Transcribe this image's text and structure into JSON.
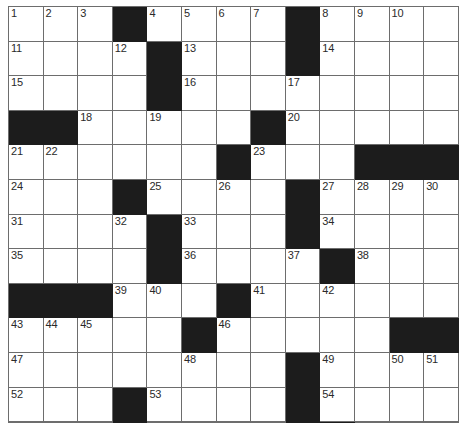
{
  "puzzle": {
    "title": "Crossword Grid",
    "rows": 12,
    "columns": 13,
    "cell_size_px": 34.6,
    "colors": {
      "block": "#1c1c1c",
      "open": "#ffffff",
      "grid_line": "#6d6d6d",
      "number_text": "#2a2a2a"
    },
    "highest_clue_number": 57,
    "grid": [
      [
        {
          "type": "open",
          "number": "1"
        },
        {
          "type": "open",
          "number": "2"
        },
        {
          "type": "open",
          "number": "3"
        },
        {
          "type": "block",
          "number": ""
        },
        {
          "type": "open",
          "number": "4"
        },
        {
          "type": "open",
          "number": "5"
        },
        {
          "type": "open",
          "number": "6"
        },
        {
          "type": "open",
          "number": "7"
        },
        {
          "type": "block",
          "number": ""
        },
        {
          "type": "open",
          "number": "8"
        },
        {
          "type": "open",
          "number": "9"
        },
        {
          "type": "open",
          "number": "10"
        },
        {
          "type": "open",
          "number": ""
        }
      ],
      [
        {
          "type": "open",
          "number": "11"
        },
        {
          "type": "open",
          "number": ""
        },
        {
          "type": "open",
          "number": ""
        },
        {
          "type": "open",
          "number": "12"
        },
        {
          "type": "block",
          "number": ""
        },
        {
          "type": "open",
          "number": "13"
        },
        {
          "type": "open",
          "number": ""
        },
        {
          "type": "open",
          "number": ""
        },
        {
          "type": "block",
          "number": ""
        },
        {
          "type": "open",
          "number": "14"
        },
        {
          "type": "open",
          "number": ""
        },
        {
          "type": "open",
          "number": ""
        },
        {
          "type": "open",
          "number": ""
        }
      ],
      [
        {
          "type": "open",
          "number": "15"
        },
        {
          "type": "open",
          "number": ""
        },
        {
          "type": "open",
          "number": ""
        },
        {
          "type": "open",
          "number": ""
        },
        {
          "type": "block",
          "number": ""
        },
        {
          "type": "open",
          "number": "16"
        },
        {
          "type": "open",
          "number": ""
        },
        {
          "type": "open",
          "number": ""
        },
        {
          "type": "open",
          "number": "17"
        },
        {
          "type": "open",
          "number": ""
        },
        {
          "type": "open",
          "number": ""
        },
        {
          "type": "open",
          "number": ""
        },
        {
          "type": "open",
          "number": ""
        }
      ],
      [
        {
          "type": "block",
          "number": ""
        },
        {
          "type": "block",
          "number": ""
        },
        {
          "type": "open",
          "number": "18"
        },
        {
          "type": "open",
          "number": ""
        },
        {
          "type": "open",
          "number": "19"
        },
        {
          "type": "open",
          "number": ""
        },
        {
          "type": "open",
          "number": ""
        },
        {
          "type": "block",
          "number": ""
        },
        {
          "type": "open",
          "number": "20"
        },
        {
          "type": "open",
          "number": ""
        },
        {
          "type": "open",
          "number": ""
        },
        {
          "type": "open",
          "number": ""
        },
        {
          "type": "open",
          "number": ""
        }
      ],
      [
        {
          "type": "open",
          "number": "21"
        },
        {
          "type": "open",
          "number": "22"
        },
        {
          "type": "open",
          "number": ""
        },
        {
          "type": "open",
          "number": ""
        },
        {
          "type": "open",
          "number": ""
        },
        {
          "type": "open",
          "number": ""
        },
        {
          "type": "block",
          "number": ""
        },
        {
          "type": "open",
          "number": "23"
        },
        {
          "type": "open",
          "number": ""
        },
        {
          "type": "open",
          "number": ""
        },
        {
          "type": "block",
          "number": ""
        },
        {
          "type": "block",
          "number": ""
        },
        {
          "type": "block",
          "number": ""
        }
      ],
      [
        {
          "type": "open",
          "number": "24"
        },
        {
          "type": "open",
          "number": ""
        },
        {
          "type": "open",
          "number": ""
        },
        {
          "type": "block",
          "number": ""
        },
        {
          "type": "open",
          "number": "25"
        },
        {
          "type": "open",
          "number": ""
        },
        {
          "type": "open",
          "number": "26"
        },
        {
          "type": "open",
          "number": ""
        },
        {
          "type": "block",
          "number": ""
        },
        {
          "type": "open",
          "number": "27"
        },
        {
          "type": "open",
          "number": "28"
        },
        {
          "type": "open",
          "number": "29"
        },
        {
          "type": "open",
          "number": "30"
        }
      ],
      [
        {
          "type": "open",
          "number": "31"
        },
        {
          "type": "open",
          "number": ""
        },
        {
          "type": "open",
          "number": ""
        },
        {
          "type": "open",
          "number": "32"
        },
        {
          "type": "block",
          "number": ""
        },
        {
          "type": "open",
          "number": "33"
        },
        {
          "type": "open",
          "number": ""
        },
        {
          "type": "open",
          "number": ""
        },
        {
          "type": "block",
          "number": ""
        },
        {
          "type": "open",
          "number": "34"
        },
        {
          "type": "open",
          "number": ""
        },
        {
          "type": "open",
          "number": ""
        },
        {
          "type": "open",
          "number": ""
        }
      ],
      [
        {
          "type": "open",
          "number": "35"
        },
        {
          "type": "open",
          "number": ""
        },
        {
          "type": "open",
          "number": ""
        },
        {
          "type": "open",
          "number": ""
        },
        {
          "type": "block",
          "number": ""
        },
        {
          "type": "open",
          "number": "36"
        },
        {
          "type": "open",
          "number": ""
        },
        {
          "type": "open",
          "number": ""
        },
        {
          "type": "open",
          "number": "37"
        },
        {
          "type": "block",
          "number": ""
        },
        {
          "type": "open",
          "number": "38"
        },
        {
          "type": "open",
          "number": ""
        },
        {
          "type": "open",
          "number": ""
        }
      ],
      [
        {
          "type": "block",
          "number": ""
        },
        {
          "type": "block",
          "number": ""
        },
        {
          "type": "block",
          "number": ""
        },
        {
          "type": "open",
          "number": "39"
        },
        {
          "type": "open",
          "number": "40"
        },
        {
          "type": "open",
          "number": ""
        },
        {
          "type": "block",
          "number": ""
        },
        {
          "type": "open",
          "number": "41"
        },
        {
          "type": "open",
          "number": ""
        },
        {
          "type": "open",
          "number": "42"
        },
        {
          "type": "open",
          "number": ""
        },
        {
          "type": "open",
          "number": ""
        },
        {
          "type": "open",
          "number": ""
        }
      ],
      [
        {
          "type": "open",
          "number": "43"
        },
        {
          "type": "open",
          "number": "44"
        },
        {
          "type": "open",
          "number": "45"
        },
        {
          "type": "open",
          "number": ""
        },
        {
          "type": "open",
          "number": ""
        },
        {
          "type": "block",
          "number": ""
        },
        {
          "type": "open",
          "number": "46"
        },
        {
          "type": "open",
          "number": ""
        },
        {
          "type": "open",
          "number": ""
        },
        {
          "type": "open",
          "number": ""
        },
        {
          "type": "open",
          "number": ""
        },
        {
          "type": "block",
          "number": ""
        },
        {
          "type": "block",
          "number": ""
        }
      ],
      [
        {
          "type": "open",
          "number": "47"
        },
        {
          "type": "open",
          "number": ""
        },
        {
          "type": "open",
          "number": ""
        },
        {
          "type": "open",
          "number": ""
        },
        {
          "type": "open",
          "number": ""
        },
        {
          "type": "open",
          "number": "48"
        },
        {
          "type": "open",
          "number": ""
        },
        {
          "type": "open",
          "number": ""
        },
        {
          "type": "block",
          "number": ""
        },
        {
          "type": "open",
          "number": "49"
        },
        {
          "type": "open",
          "number": ""
        },
        {
          "type": "open",
          "number": "50"
        },
        {
          "type": "open",
          "number": "51"
        }
      ],
      [
        {
          "type": "open",
          "number": "52"
        },
        {
          "type": "open",
          "number": ""
        },
        {
          "type": "open",
          "number": ""
        },
        {
          "type": "block",
          "number": ""
        },
        {
          "type": "open",
          "number": "53"
        },
        {
          "type": "open",
          "number": ""
        },
        {
          "type": "open",
          "number": ""
        },
        {
          "type": "open",
          "number": ""
        },
        {
          "type": "block",
          "number": ""
        },
        {
          "type": "open",
          "number": "54"
        },
        {
          "type": "open",
          "number": ""
        },
        {
          "type": "open",
          "number": ""
        },
        {
          "type": "open",
          "number": ""
        }
      ],
      [
        {
          "type": "open",
          "number": "55"
        },
        {
          "type": "open",
          "number": ""
        },
        {
          "type": "open",
          "number": ""
        },
        {
          "type": "block",
          "number": ""
        },
        {
          "type": "open",
          "number": "56"
        },
        {
          "type": "open",
          "number": ""
        },
        {
          "type": "open",
          "number": ""
        },
        {
          "type": "open",
          "number": ""
        },
        {
          "type": "block",
          "number": ""
        },
        {
          "type": "block",
          "number": ""
        },
        {
          "type": "open",
          "number": "57"
        },
        {
          "type": "open",
          "number": ""
        },
        {
          "type": "open",
          "number": ""
        }
      ]
    ]
  }
}
